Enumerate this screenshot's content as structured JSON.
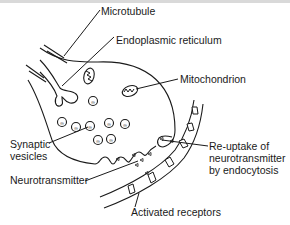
{
  "diagram": {
    "labels": {
      "microtubule": "Microtubule",
      "endoplasmic_reticulum": "Endoplasmic reticulum",
      "mitochondrion": "Mitochondrion",
      "synaptic_vesicles_line1": "Synaptic",
      "synaptic_vesicles_line2": "vesicles",
      "neurotransmitter": "Neurotransmitter",
      "reuptake_line1": "Re-uptake of",
      "reuptake_line2": "neurotransmitter",
      "reuptake_line3": "by endocytosis",
      "activated_receptors": "Activated receptors"
    }
  }
}
